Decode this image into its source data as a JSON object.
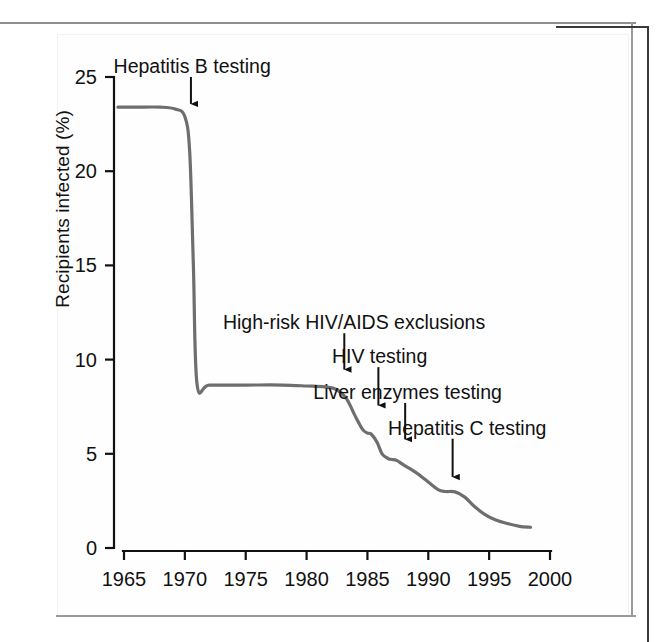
{
  "figure": {
    "y_axis_title": "Recipients infected (%)"
  },
  "chart_data": {
    "type": "line",
    "title": "",
    "xlabel": "",
    "ylabel": "Recipients infected (%)",
    "xlim": [
      1964,
      2000
    ],
    "ylim": [
      0,
      25
    ],
    "xticks": [
      1965,
      1970,
      1975,
      1980,
      1985,
      1990,
      1995,
      2000
    ],
    "xtick_labels": [
      "1965",
      "1970",
      "1975",
      "1980",
      "1985",
      "1990",
      "1995",
      "2000"
    ],
    "yticks": [
      0,
      5,
      10,
      15,
      20,
      25
    ],
    "ytick_labels": [
      "0",
      "5",
      "10",
      "15",
      "20",
      "25"
    ],
    "grid": false,
    "legend": "none",
    "line_color": "#6e6e6e",
    "axis_color": "#111111",
    "series": [
      {
        "name": "Recipients infected (%)",
        "x": [
          1964.5,
          1966,
          1968,
          1969.2,
          1970.0,
          1970.4,
          1970.7,
          1971.0,
          1972,
          1975,
          1978,
          1980,
          1981.5,
          1982.5,
          1983.3,
          1984.0,
          1984.6,
          1985.0,
          1985.3,
          1985.8,
          1986.2,
          1986.7,
          1987.0,
          1987.4,
          1988.0,
          1989.0,
          1990.0,
          1990.8,
          1991.4,
          1992.2,
          1993.0,
          1993.8,
          1994.6,
          1995.5,
          1996.5,
          1997.5,
          1998.4
        ],
        "y": [
          23.4,
          23.4,
          23.4,
          23.3,
          22.9,
          21.0,
          15.0,
          8.7,
          8.65,
          8.65,
          8.65,
          8.6,
          8.55,
          8.4,
          7.9,
          7.0,
          6.3,
          6.1,
          6.05,
          5.6,
          5.0,
          4.75,
          4.7,
          4.65,
          4.4,
          4.0,
          3.5,
          3.1,
          3.0,
          2.98,
          2.7,
          2.2,
          1.8,
          1.5,
          1.3,
          1.15,
          1.1
        ]
      }
    ],
    "annotations": [
      {
        "id": "hepatitis-b-testing",
        "label": "Hepatitis B testing",
        "text_x": 1970.6,
        "arrow_x": 1970.5,
        "arrow_y_top": 25.0,
        "arrow_y_tip": 23.2
      },
      {
        "id": "high-risk-hiv-aids-exclusions",
        "label": "High-risk HIV/AIDS exclusions",
        "text_x": 1983.9,
        "arrow_x": 1983.1,
        "arrow_y_top": 11.4,
        "arrow_y_tip": 9.1
      },
      {
        "id": "hiv-testing",
        "label": "HIV testing",
        "text_x": 1986.0,
        "arrow_x": 1985.9,
        "arrow_y_top": 9.6,
        "arrow_y_tip": 7.2
      },
      {
        "id": "liver-enzymes-testing",
        "label": "Liver enzymes testing",
        "text_x": 1988.3,
        "arrow_x": 1988.1,
        "arrow_y_top": 7.7,
        "arrow_y_tip": 5.4
      },
      {
        "id": "hepatitis-c-testing",
        "label": "Hepatitis C testing",
        "text_x": 1993.2,
        "arrow_x": 1992.0,
        "arrow_y_top": 5.8,
        "arrow_y_tip": 3.4
      }
    ]
  }
}
